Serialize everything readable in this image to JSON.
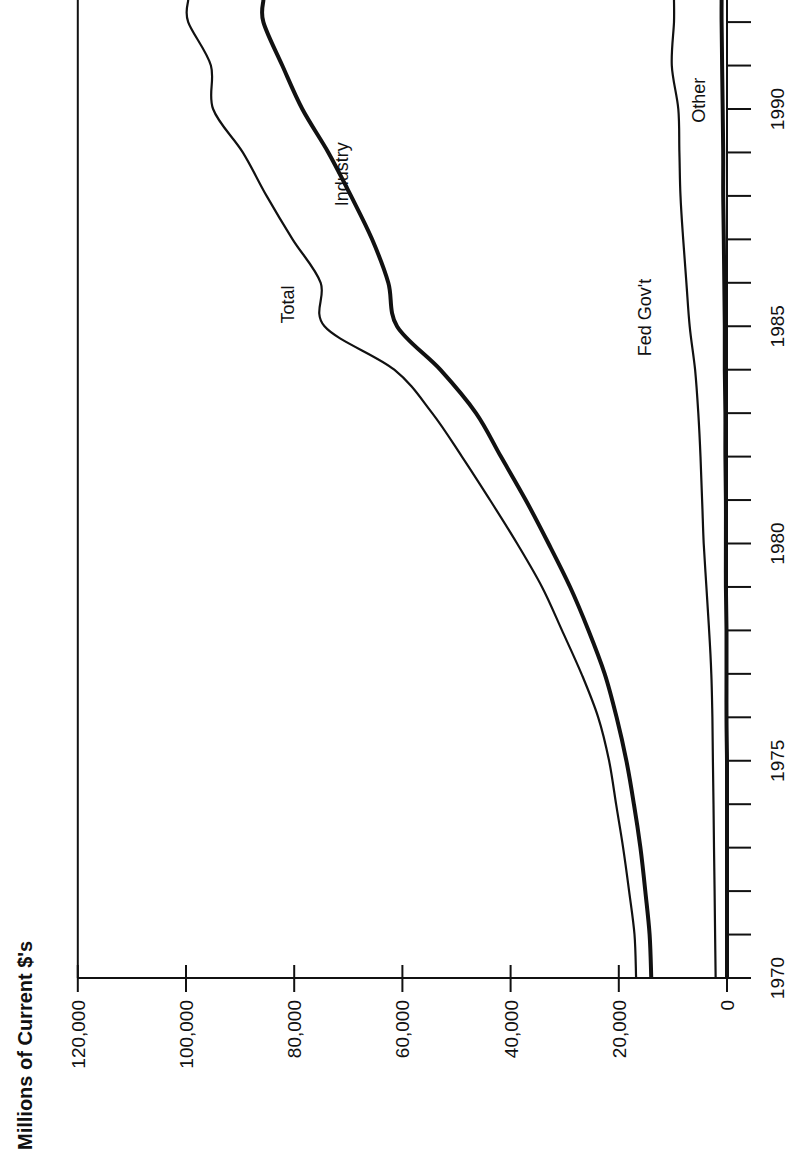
{
  "chart_data": {
    "type": "line",
    "orientation": "rotated-90-ccw",
    "title": "",
    "ylabel": "Millions of Current $'s",
    "xlabel": "",
    "x": [
      1970,
      1971,
      1972,
      1973,
      1974,
      1975,
      1976,
      1977,
      1978,
      1979,
      1980,
      1981,
      1982,
      1983,
      1984,
      1985,
      1986,
      1987,
      1988,
      1989,
      1990,
      1991,
      1992
    ],
    "xticks_labeled": [
      1970,
      1975,
      1980,
      1985,
      1990
    ],
    "xlim": [
      1970,
      1992.5
    ],
    "ylim": [
      0,
      120000
    ],
    "yticks": [
      0,
      20000,
      40000,
      60000,
      80000,
      100000,
      120000
    ],
    "ytick_labels": [
      "0",
      "20,000",
      "40,000",
      "60,000",
      "80,000",
      "100,000",
      "120,000"
    ],
    "grid": false,
    "series": [
      {
        "name": "Total",
        "stroke_width": 2.2,
        "values": [
          16800,
          17100,
          18100,
          19200,
          20500,
          21800,
          23800,
          26900,
          30500,
          34200,
          38800,
          43800,
          49000,
          54500,
          61500,
          74400,
          75100,
          80300,
          85100,
          89500,
          95000,
          95400,
          99600
        ]
      },
      {
        "name": "Industry",
        "stroke_width": 4,
        "values": [
          14000,
          14300,
          15100,
          16000,
          17200,
          18600,
          20400,
          22600,
          25600,
          29000,
          33000,
          37200,
          41800,
          46400,
          53000,
          61000,
          62600,
          65600,
          69500,
          73700,
          78500,
          82200,
          85700
        ]
      },
      {
        "name": "Fed Gov't",
        "stroke_width": 2.2,
        "values": [
          2100,
          2200,
          2300,
          2400,
          2500,
          2600,
          2700,
          2900,
          3300,
          3800,
          4300,
          4600,
          4900,
          5300,
          5900,
          6900,
          7500,
          8100,
          8600,
          8800,
          9000,
          10200,
          9800
        ]
      },
      {
        "name": "Other",
        "stroke_width": 4,
        "values": [
          0,
          0,
          0,
          0,
          0,
          0,
          100,
          100,
          100,
          200,
          200,
          200,
          300,
          300,
          400,
          400,
          500,
          600,
          700,
          700,
          800,
          900,
          1000
        ]
      }
    ],
    "annotations": [
      {
        "text": "Total",
        "near_year": 1985.5,
        "near_value": 80000
      },
      {
        "text": "Industry",
        "near_year": 1988.5,
        "near_value": 70000
      },
      {
        "text": "Fed Gov't",
        "near_year": 1985.2,
        "near_value": 14000
      },
      {
        "text": "Other",
        "near_year": 1990.2,
        "near_value": 4000
      }
    ]
  },
  "labels": {
    "axis_title": "Millions of Current $'s",
    "series_labels": [
      "Total",
      "Industry",
      "Fed Gov't",
      "Other"
    ]
  }
}
